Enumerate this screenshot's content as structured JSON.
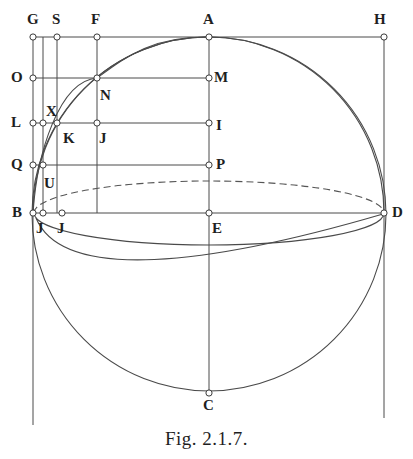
{
  "figure": {
    "caption": "Fig. 2.1.7.",
    "type": "geometric-construction-diagram",
    "canvas": {
      "width": 413,
      "height": 459
    },
    "stroke_color": "#4a4a4a",
    "dash_color": "#555555",
    "marker_fill": "#ffffff",
    "label_color": "#1f1f1f"
  },
  "labels": [
    {
      "text": "G",
      "x": 27,
      "y": 12,
      "name": "vertex-label-g"
    },
    {
      "text": "S",
      "x": 52,
      "y": 12,
      "name": "vertex-label-s"
    },
    {
      "text": "F",
      "x": 91,
      "y": 12,
      "name": "vertex-label-f"
    },
    {
      "text": "A",
      "x": 203,
      "y": 12,
      "name": "vertex-label-a"
    },
    {
      "text": "H",
      "x": 374,
      "y": 12,
      "name": "vertex-label-h"
    },
    {
      "text": "O",
      "x": 11,
      "y": 70,
      "name": "vertex-label-o"
    },
    {
      "text": "M",
      "x": 214,
      "y": 70,
      "name": "vertex-label-m"
    },
    {
      "text": "N",
      "x": 100,
      "y": 88,
      "name": "vertex-label-n"
    },
    {
      "text": "X",
      "x": 46,
      "y": 104,
      "name": "vertex-label-x"
    },
    {
      "text": "L",
      "x": 11,
      "y": 115,
      "name": "vertex-label-l"
    },
    {
      "text": "I",
      "x": 216,
      "y": 118,
      "name": "vertex-label-i"
    },
    {
      "text": "K",
      "x": 63,
      "y": 131,
      "name": "vertex-label-k"
    },
    {
      "text": "J",
      "x": 99,
      "y": 131,
      "name": "vertex-label-j-upper"
    },
    {
      "text": "Q",
      "x": 11,
      "y": 157,
      "name": "vertex-label-q"
    },
    {
      "text": "P",
      "x": 216,
      "y": 157,
      "name": "vertex-label-p"
    },
    {
      "text": "U",
      "x": 44,
      "y": 176,
      "name": "vertex-label-u"
    },
    {
      "text": "B",
      "x": 12,
      "y": 205,
      "name": "vertex-label-b"
    },
    {
      "text": "D",
      "x": 392,
      "y": 205,
      "name": "vertex-label-d"
    },
    {
      "text": "J",
      "x": 36,
      "y": 221,
      "name": "vertex-label-j-left"
    },
    {
      "text": "J",
      "x": 57,
      "y": 221,
      "name": "vertex-label-j-mid"
    },
    {
      "text": "E",
      "x": 212,
      "y": 221,
      "name": "vertex-label-e"
    },
    {
      "text": "C",
      "x": 203,
      "y": 398,
      "name": "vertex-label-c"
    }
  ],
  "points": [
    {
      "id": "G",
      "x": 33,
      "y": 37
    },
    {
      "id": "S",
      "x": 57,
      "y": 37
    },
    {
      "id": "F",
      "x": 97,
      "y": 37
    },
    {
      "id": "A",
      "x": 209,
      "y": 37
    },
    {
      "id": "H",
      "x": 384,
      "y": 37
    },
    {
      "id": "O",
      "x": 33,
      "y": 78
    },
    {
      "id": "N",
      "x": 97,
      "y": 78
    },
    {
      "id": "M",
      "x": 209,
      "y": 78
    },
    {
      "id": "L",
      "x": 33,
      "y": 123
    },
    {
      "id": "Lb",
      "x": 43,
      "y": 123
    },
    {
      "id": "X",
      "x": 57,
      "y": 123
    },
    {
      "id": "Jup",
      "x": 97,
      "y": 123
    },
    {
      "id": "I",
      "x": 209,
      "y": 123
    },
    {
      "id": "Q",
      "x": 33,
      "y": 165
    },
    {
      "id": "U",
      "x": 43,
      "y": 165
    },
    {
      "id": "P",
      "x": 209,
      "y": 165
    },
    {
      "id": "B",
      "x": 33,
      "y": 213
    },
    {
      "id": "J1",
      "x": 43,
      "y": 213
    },
    {
      "id": "J2",
      "x": 62,
      "y": 213
    },
    {
      "id": "E",
      "x": 209,
      "y": 213
    },
    {
      "id": "D",
      "x": 384,
      "y": 213
    },
    {
      "id": "C",
      "x": 209,
      "y": 393
    }
  ],
  "geometry": {
    "main_circle": {
      "cx": 209,
      "cy": 214,
      "r": 177
    },
    "equator_ellipse": {
      "cx": 209,
      "cy": 213,
      "rx": 175,
      "ry": 32
    },
    "vertical_lines": [
      {
        "x": 33,
        "y1": 37,
        "y2": 425
      },
      {
        "x": 43,
        "y1": 37,
        "y2": 213
      },
      {
        "x": 57,
        "y1": 37,
        "y2": 213
      },
      {
        "x": 97,
        "y1": 37,
        "y2": 213
      },
      {
        "x": 209,
        "y1": 37,
        "y2": 393
      },
      {
        "x": 384,
        "y1": 37,
        "y2": 418
      }
    ],
    "horizontal_lines": [
      {
        "y": 37,
        "x1": 33,
        "x2": 384
      },
      {
        "y": 78,
        "x1": 33,
        "x2": 209
      },
      {
        "y": 123,
        "x1": 33,
        "x2": 209
      },
      {
        "y": 165,
        "x1": 33,
        "x2": 209
      },
      {
        "y": 213,
        "x1": 33,
        "x2": 384
      }
    ]
  }
}
